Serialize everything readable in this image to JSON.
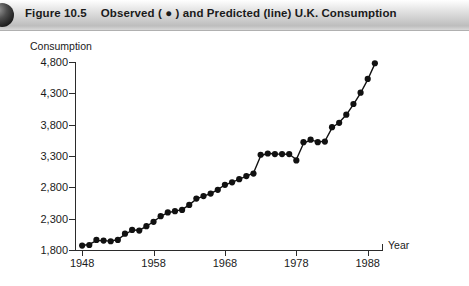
{
  "figure": {
    "banner": {
      "label": "Figure 10.5",
      "description": "Observed ( ● ) and Predicted (line) U.K. Consumption",
      "bullet_glyph": "●",
      "accent_color": "#c9c9c9",
      "text_color": "#1a1a1a"
    }
  },
  "chart_data": {
    "type": "line",
    "title": "Observed ( ● ) and Predicted (line) U.K. Consumption",
    "xlabel": "Year",
    "ylabel": "Consumption",
    "xlim": [
      1947,
      1990
    ],
    "ylim": [
      1800,
      4800
    ],
    "grid": false,
    "legend_position": "none",
    "y_ticks": [
      1800,
      2300,
      2800,
      3300,
      3800,
      4300,
      4800
    ],
    "y_tick_labels": [
      "1,800",
      "2,300",
      "2,800",
      "3,300",
      "3,800",
      "4,300",
      "4,800"
    ],
    "x_ticks": [
      1948,
      1958,
      1968,
      1978,
      1988
    ],
    "x_tick_labels": [
      "1948",
      "1958",
      "1968",
      "1978",
      "1988"
    ],
    "marker": {
      "shape": "circle",
      "color": "#111111",
      "radius": 3.1
    },
    "line": {
      "color": "#111111",
      "width": 1.4,
      "name": "Predicted"
    },
    "series": [
      {
        "name": "Observed",
        "x": [
          1948,
          1949,
          1950,
          1951,
          1952,
          1953,
          1954,
          1955,
          1956,
          1957,
          1958,
          1959,
          1960,
          1961,
          1962,
          1963,
          1964,
          1965,
          1966,
          1967,
          1968,
          1969,
          1970,
          1971,
          1972,
          1973,
          1974,
          1975,
          1976,
          1977,
          1978,
          1979,
          1980,
          1981,
          1982,
          1983,
          1984,
          1985,
          1986,
          1987,
          1988,
          1989
        ],
        "values": [
          1870,
          1880,
          1960,
          1950,
          1940,
          1960,
          2060,
          2120,
          2110,
          2180,
          2250,
          2340,
          2400,
          2420,
          2440,
          2520,
          2620,
          2660,
          2700,
          2760,
          2840,
          2880,
          2930,
          2980,
          3020,
          3320,
          3340,
          3330,
          3330,
          3330,
          3230,
          3520,
          3560,
          3520,
          3530,
          3760,
          3830,
          3960,
          4130,
          4310,
          4530,
          4780
        ]
      },
      {
        "name": "Predicted",
        "x": [
          1948,
          1949,
          1950,
          1951,
          1952,
          1953,
          1954,
          1955,
          1956,
          1957,
          1958,
          1959,
          1960,
          1961,
          1962,
          1963,
          1964,
          1965,
          1966,
          1967,
          1968,
          1969,
          1970,
          1971,
          1972,
          1973,
          1974,
          1975,
          1976,
          1977,
          1978,
          1979,
          1980,
          1981,
          1982,
          1983,
          1984,
          1985,
          1986,
          1987,
          1988,
          1989
        ],
        "values": [
          1872,
          1890,
          1950,
          1950,
          1942,
          1968,
          2050,
          2115,
          2118,
          2175,
          2255,
          2335,
          2395,
          2420,
          2445,
          2520,
          2615,
          2660,
          2700,
          2765,
          2838,
          2880,
          2930,
          2975,
          3030,
          3300,
          3345,
          3332,
          3330,
          3328,
          3245,
          3500,
          3558,
          3525,
          3535,
          3750,
          3835,
          3958,
          4125,
          4305,
          4520,
          4770
        ]
      }
    ]
  }
}
